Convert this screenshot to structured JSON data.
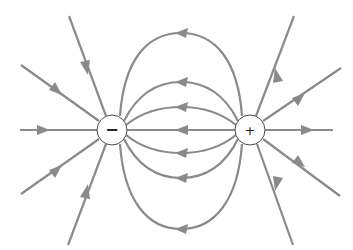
{
  "diagram": {
    "line_color": "#8a8a8a",
    "charges": [
      {
        "name": "negative-charge",
        "sign": "−",
        "cx": 112,
        "cy": 130,
        "r": 15
      },
      {
        "name": "positive-charge",
        "sign": "+",
        "cx": 250,
        "cy": 130,
        "r": 15
      }
    ],
    "field_lines": {
      "inner_connecting": "field lines arc from positive charge (+) to negative charge (−)",
      "outer_incoming": "straight lines enter negative charge from the left",
      "outer_outgoing": "straight lines leave positive charge to the right"
    }
  }
}
